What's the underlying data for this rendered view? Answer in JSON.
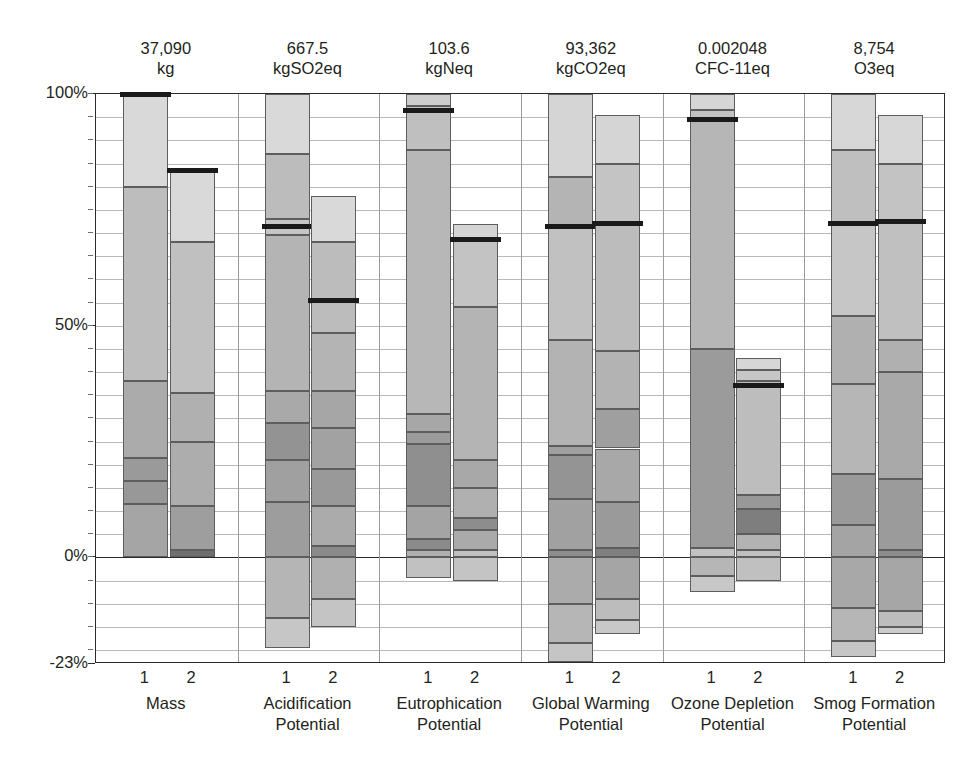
{
  "chart_data": {
    "type": "bar",
    "subtype": "stacked-bar-contribution",
    "title": "",
    "xlabel": "",
    "ylabel": "",
    "ylim": [
      -23,
      100
    ],
    "yticks": [
      {
        "value": 100,
        "label": "100%"
      },
      {
        "value": 50,
        "label": "50%"
      },
      {
        "value": 0,
        "label": "0%"
      },
      {
        "value": -23,
        "label": "-23%"
      }
    ],
    "minor_tick_step": 5,
    "grid": true,
    "legend": "none",
    "bar_labels": [
      "1",
      "2"
    ],
    "categories": [
      {
        "name": "Mass",
        "label_line1": "Mass",
        "label_line2": "",
        "total_value": "37,090",
        "unit": "kg",
        "bars": [
          {
            "label": "1",
            "marker_percent": 100,
            "segments": [
              {
                "from": 80.0,
                "to": 100.0,
                "shade": "#d9d9d9"
              },
              {
                "from": 38.0,
                "to": 80.0,
                "shade": "#bdbdbd"
              },
              {
                "from": 21.5,
                "to": 38.0,
                "shade": "#ababab"
              },
              {
                "from": 16.5,
                "to": 21.5,
                "shade": "#9a9a9a"
              },
              {
                "from": 11.5,
                "to": 16.5,
                "shade": "#989898"
              },
              {
                "from": 0.0,
                "to": 11.5,
                "shade": "#a5a5a5"
              }
            ]
          },
          {
            "label": "2",
            "marker_percent": 83.5,
            "segments": [
              {
                "from": 68.0,
                "to": 83.5,
                "shade": "#d9d9d9"
              },
              {
                "from": 35.5,
                "to": 68.0,
                "shade": "#c0c0c0"
              },
              {
                "from": 25.0,
                "to": 35.5,
                "shade": "#b0b0b0"
              },
              {
                "from": 11.0,
                "to": 25.0,
                "shade": "#adadad"
              },
              {
                "from": 1.5,
                "to": 11.0,
                "shade": "#9e9e9e"
              },
              {
                "from": 0.0,
                "to": 1.5,
                "shade": "#6f6f6f"
              }
            ]
          }
        ]
      },
      {
        "name": "Acidification Potential",
        "label_line1": "Acidification",
        "label_line2": "Potential",
        "total_value": "667.5",
        "unit": "kgSO2eq",
        "bars": [
          {
            "label": "1",
            "marker_percent": 71.5,
            "segments": [
              {
                "from": 87.0,
                "to": 100.0,
                "shade": "#d9d9d9"
              },
              {
                "from": 73.0,
                "to": 87.0,
                "shade": "#bcbcbc"
              },
              {
                "from": 69.5,
                "to": 73.0,
                "shade": "#c6c6c6"
              },
              {
                "from": 36.0,
                "to": 69.5,
                "shade": "#b4b4b4"
              },
              {
                "from": 29.0,
                "to": 36.0,
                "shade": "#a9a9a9"
              },
              {
                "from": 21.0,
                "to": 29.0,
                "shade": "#939393"
              },
              {
                "from": 12.0,
                "to": 21.0,
                "shade": "#a0a0a0"
              },
              {
                "from": 0.0,
                "to": 12.0,
                "shade": "#9d9d9d"
              },
              {
                "from": -13.0,
                "to": 0.0,
                "shade": "#b5b5b5"
              },
              {
                "from": -19.5,
                "to": -13.0,
                "shade": "#c6c6c6"
              }
            ]
          },
          {
            "label": "2",
            "marker_percent": 55.5,
            "segments": [
              {
                "from": 68.0,
                "to": 78.0,
                "shade": "#d9d9d9"
              },
              {
                "from": 48.5,
                "to": 68.0,
                "shade": "#bcbcbc"
              },
              {
                "from": 36.0,
                "to": 48.5,
                "shade": "#b4b4b4"
              },
              {
                "from": 28.0,
                "to": 36.0,
                "shade": "#a6a6a6"
              },
              {
                "from": 19.0,
                "to": 28.0,
                "shade": "#a2a2a2"
              },
              {
                "from": 11.0,
                "to": 19.0,
                "shade": "#999999"
              },
              {
                "from": 2.5,
                "to": 11.0,
                "shade": "#ababab"
              },
              {
                "from": 0.0,
                "to": 2.5,
                "shade": "#8a8a8a"
              },
              {
                "from": -9.0,
                "to": 0.0,
                "shade": "#b0b0b0"
              },
              {
                "from": -15.0,
                "to": -9.0,
                "shade": "#c4c4c4"
              }
            ]
          }
        ]
      },
      {
        "name": "Eutrophication Potential",
        "label_line1": "Eutrophication",
        "label_line2": "Potential",
        "total_value": "103.6",
        "unit": "kgNeq",
        "bars": [
          {
            "label": "1",
            "marker_percent": 96.5,
            "segments": [
              {
                "from": 97.5,
                "to": 100.0,
                "shade": "#cdcdcd"
              },
              {
                "from": 88.0,
                "to": 97.5,
                "shade": "#bfbfbf"
              },
              {
                "from": 31.0,
                "to": 88.0,
                "shade": "#b7b7b7"
              },
              {
                "from": 27.0,
                "to": 31.0,
                "shade": "#a7a7a7"
              },
              {
                "from": 24.5,
                "to": 27.0,
                "shade": "#9b9b9b"
              },
              {
                "from": 11.0,
                "to": 24.5,
                "shade": "#8f8f8f"
              },
              {
                "from": 4.0,
                "to": 11.0,
                "shade": "#a4a4a4"
              },
              {
                "from": 1.5,
                "to": 4.0,
                "shade": "#8b8b8b"
              },
              {
                "from": 0.0,
                "to": 1.5,
                "shade": "#b0b0b0"
              },
              {
                "from": -4.5,
                "to": 0.0,
                "shade": "#c1c1c1"
              }
            ]
          },
          {
            "label": "2",
            "marker_percent": 68.5,
            "segments": [
              {
                "from": 68.5,
                "to": 72.0,
                "shade": "#d4d4d4"
              },
              {
                "from": 54.0,
                "to": 68.5,
                "shade": "#c3c3c3"
              },
              {
                "from": 21.0,
                "to": 54.0,
                "shade": "#b4b4b4"
              },
              {
                "from": 15.0,
                "to": 21.0,
                "shade": "#a8a8a8"
              },
              {
                "from": 8.5,
                "to": 15.0,
                "shade": "#b0b0b0"
              },
              {
                "from": 6.0,
                "to": 8.5,
                "shade": "#8d8d8d"
              },
              {
                "from": 1.5,
                "to": 6.0,
                "shade": "#aaaaaa"
              },
              {
                "from": 0.0,
                "to": 1.5,
                "shade": "#c0c0c0"
              },
              {
                "from": -5.0,
                "to": 0.0,
                "shade": "#c4c4c4"
              }
            ]
          }
        ]
      },
      {
        "name": "Global Warming Potential",
        "label_line1": "Global Warming",
        "label_line2": "Potential",
        "total_value": "93,362",
        "unit": "kgCO2eq",
        "bars": [
          {
            "label": "1",
            "marker_percent": 71.5,
            "segments": [
              {
                "from": 82.0,
                "to": 100.0,
                "shade": "#d5d5d5"
              },
              {
                "from": 71.5,
                "to": 82.0,
                "shade": "#b4b4b4"
              },
              {
                "from": 47.0,
                "to": 71.5,
                "shade": "#c1c1c1"
              },
              {
                "from": 24.0,
                "to": 47.0,
                "shade": "#b3b3b3"
              },
              {
                "from": 22.0,
                "to": 24.0,
                "shade": "#a0a0a0"
              },
              {
                "from": 12.5,
                "to": 22.0,
                "shade": "#949494"
              },
              {
                "from": 1.5,
                "to": 12.5,
                "shade": "#a1a1a1"
              },
              {
                "from": 0.0,
                "to": 1.5,
                "shade": "#8d8d8d"
              },
              {
                "from": -10.0,
                "to": 0.0,
                "shade": "#ababab"
              },
              {
                "from": -18.5,
                "to": -10.0,
                "shade": "#b6b6b6"
              },
              {
                "from": -22.5,
                "to": -18.5,
                "shade": "#c5c5c5"
              }
            ]
          },
          {
            "label": "2",
            "marker_percent": 72.0,
            "segments": [
              {
                "from": 85.0,
                "to": 95.5,
                "shade": "#d5d5d5"
              },
              {
                "from": 72.0,
                "to": 85.0,
                "shade": "#c4c4c4"
              },
              {
                "from": 44.5,
                "to": 72.0,
                "shade": "#bcbcbc"
              },
              {
                "from": 32.0,
                "to": 44.5,
                "shade": "#b3b3b3"
              },
              {
                "from": 23.5,
                "to": 32.0,
                "shade": "#9f9f9f"
              },
              {
                "from": 12.0,
                "to": 23.5,
                "shade": "#a8a8a8"
              },
              {
                "from": 2.0,
                "to": 12.0,
                "shade": "#9a9a9a"
              },
              {
                "from": 0.0,
                "to": 2.0,
                "shade": "#808080"
              },
              {
                "from": -9.0,
                "to": 0.0,
                "shade": "#a5a5a5"
              },
              {
                "from": -13.5,
                "to": -9.0,
                "shade": "#bcbcbc"
              },
              {
                "from": -16.5,
                "to": -13.5,
                "shade": "#c8c8c8"
              }
            ]
          }
        ]
      },
      {
        "name": "Ozone Depletion Potential",
        "label_line1": "Ozone Depletion",
        "label_line2": "Potential",
        "total_value": "0.002048",
        "unit": "CFC-11eq",
        "bars": [
          {
            "label": "1",
            "marker_percent": 94.5,
            "segments": [
              {
                "from": 96.5,
                "to": 100.0,
                "shade": "#d5d5d5"
              },
              {
                "from": 94.5,
                "to": 96.5,
                "shade": "#c2c2c2"
              },
              {
                "from": 45.0,
                "to": 94.5,
                "shade": "#b6b6b6"
              },
              {
                "from": 2.0,
                "to": 45.0,
                "shade": "#9b9b9b"
              },
              {
                "from": 0.0,
                "to": 2.0,
                "shade": "#c2c2c2"
              },
              {
                "from": -4.0,
                "to": 0.0,
                "shade": "#b6b6b6"
              },
              {
                "from": -7.5,
                "to": -4.0,
                "shade": "#c8c8c8"
              }
            ]
          },
          {
            "label": "2",
            "marker_percent": 37.0,
            "segments": [
              {
                "from": 40.5,
                "to": 43.0,
                "shade": "#d6d6d6"
              },
              {
                "from": 38.0,
                "to": 40.5,
                "shade": "#c6c6c6"
              },
              {
                "from": 13.5,
                "to": 38.0,
                "shade": "#bdbdbd"
              },
              {
                "from": 10.5,
                "to": 13.5,
                "shade": "#989898"
              },
              {
                "from": 5.0,
                "to": 10.5,
                "shade": "#7e7e7e"
              },
              {
                "from": 1.5,
                "to": 5.0,
                "shade": "#b3b3b3"
              },
              {
                "from": 0.0,
                "to": 1.5,
                "shade": "#c0c0c0"
              },
              {
                "from": -5.0,
                "to": 0.0,
                "shade": "#c0c0c0"
              }
            ]
          }
        ]
      },
      {
        "name": "Smog Formation Potential",
        "label_line1": "Smog Formation",
        "label_line2": "Potential",
        "total_value": "8,754",
        "unit": "O3eq",
        "bars": [
          {
            "label": "1",
            "marker_percent": 72.0,
            "segments": [
              {
                "from": 88.0,
                "to": 100.0,
                "shade": "#d7d7d7"
              },
              {
                "from": 72.0,
                "to": 88.0,
                "shade": "#bfbfbf"
              },
              {
                "from": 52.0,
                "to": 72.0,
                "shade": "#c6c6c6"
              },
              {
                "from": 37.5,
                "to": 52.0,
                "shade": "#b0b0b0"
              },
              {
                "from": 18.0,
                "to": 37.5,
                "shade": "#b6b6b6"
              },
              {
                "from": 7.0,
                "to": 18.0,
                "shade": "#9a9a9a"
              },
              {
                "from": 0.0,
                "to": 7.0,
                "shade": "#a4a4a4"
              },
              {
                "from": -11.0,
                "to": 0.0,
                "shade": "#a8a8a8"
              },
              {
                "from": -18.0,
                "to": -11.0,
                "shade": "#b6b6b6"
              },
              {
                "from": -21.5,
                "to": -18.0,
                "shade": "#c6c6c6"
              }
            ]
          },
          {
            "label": "2",
            "marker_percent": 72.5,
            "segments": [
              {
                "from": 85.0,
                "to": 95.5,
                "shade": "#d7d7d7"
              },
              {
                "from": 72.5,
                "to": 85.0,
                "shade": "#c3c3c3"
              },
              {
                "from": 47.0,
                "to": 72.5,
                "shade": "#c0c0c0"
              },
              {
                "from": 40.0,
                "to": 47.0,
                "shade": "#b0b0b0"
              },
              {
                "from": 17.0,
                "to": 40.0,
                "shade": "#a9a9a9"
              },
              {
                "from": 1.5,
                "to": 17.0,
                "shade": "#9b9b9b"
              },
              {
                "from": 0.0,
                "to": 1.5,
                "shade": "#8d8d8d"
              },
              {
                "from": -11.5,
                "to": 0.0,
                "shade": "#a6a6a6"
              },
              {
                "from": -15.0,
                "to": -11.5,
                "shade": "#bdbdbd"
              },
              {
                "from": -16.5,
                "to": -15.0,
                "shade": "#cccccc"
              }
            ]
          }
        ]
      }
    ]
  }
}
